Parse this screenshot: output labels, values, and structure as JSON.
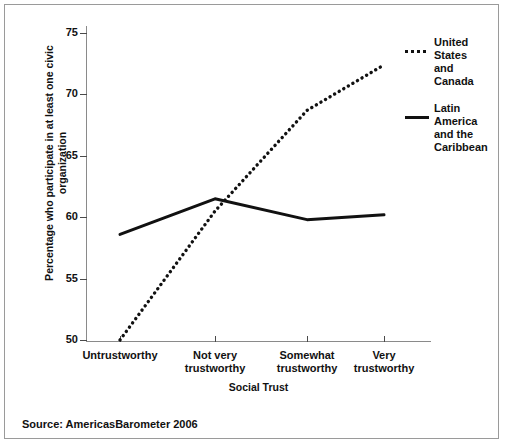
{
  "chart_data": {
    "type": "line",
    "title": "",
    "subtitle": "",
    "xlabel": "Social Trust",
    "ylabel": "Percentage who participate in at least one civic organization",
    "categories": [
      "Untrustworthy",
      "Not very trustworthy",
      "Somewhat trustworthy",
      "Very trustworthy"
    ],
    "category_lines": [
      [
        "Untrustworthy"
      ],
      [
        "Not very",
        "trustworthy"
      ],
      [
        "Somewhat",
        "trustworthy"
      ],
      [
        "Very",
        "trustworthy"
      ]
    ],
    "ylim": [
      49,
      76.5
    ],
    "yticks": [
      50,
      55,
      60,
      65,
      70,
      75
    ],
    "ytick_labels": [
      "50",
      "55",
      "60",
      "65",
      "70",
      "75"
    ],
    "grid": false,
    "legend_position": "right",
    "series": [
      {
        "name": "United States and Canada",
        "name_lines": [
          "United",
          "States",
          "and",
          "Canada"
        ],
        "style": "dotted",
        "color": "#111111",
        "values": [
          50.0,
          60.5,
          68.7,
          72.4
        ]
      },
      {
        "name": "Latin America and the Caribbean",
        "name_lines": [
          "Latin",
          "America",
          "and the",
          "Caribbean"
        ],
        "style": "solid",
        "color": "#111111",
        "values": [
          58.6,
          61.5,
          59.8,
          60.2
        ]
      }
    ],
    "annotations": []
  },
  "source": {
    "text": "Source: AmericasBarometer 2006"
  }
}
